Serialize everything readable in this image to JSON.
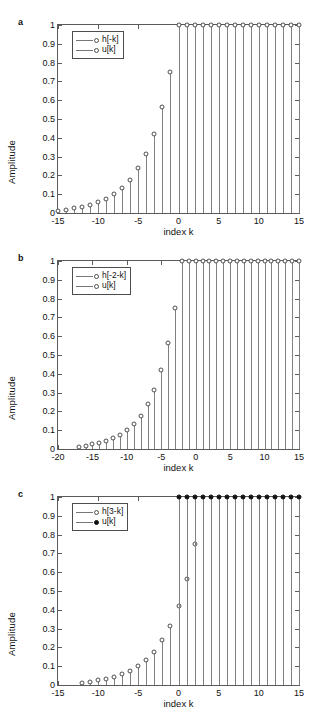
{
  "figure": {
    "panels": [
      {
        "letter": "a",
        "ylabel": "Amplitude",
        "xlabel": "index k",
        "legend": [
          {
            "label": "h[-k]",
            "marker": "open-circle"
          },
          {
            "label": "u[k]",
            "marker": "open-circle"
          }
        ],
        "xticks": [
          "-15",
          "-10",
          "-5",
          "0",
          "5",
          "10",
          "15"
        ],
        "yticks": [
          "0",
          "0.1",
          "0.2",
          "0.3",
          "0.4",
          "0.5",
          "0.6",
          "0.7",
          "0.8",
          "0.9",
          "1"
        ]
      },
      {
        "letter": "b",
        "ylabel": "Amplitude",
        "xlabel": "index k",
        "legend": [
          {
            "label": "h[-2-k]",
            "marker": "open-circle"
          },
          {
            "label": "u[k]",
            "marker": "open-circle"
          }
        ],
        "xticks": [
          "-20",
          "-15",
          "-10",
          "-5",
          "0",
          "5",
          "10",
          "15"
        ],
        "yticks": [
          "0",
          "0.1",
          "0.2",
          "0.3",
          "0.4",
          "0.5",
          "0.6",
          "0.7",
          "0.8",
          "0.9",
          "1"
        ]
      },
      {
        "letter": "c",
        "ylabel": "Amplitude",
        "xlabel": "index k",
        "legend": [
          {
            "label": "h[3-k]",
            "marker": "open-circle"
          },
          {
            "label": "u[k]",
            "marker": "filled-circle"
          }
        ],
        "xticks": [
          "-15",
          "-10",
          "-5",
          "0",
          "5",
          "10",
          "15"
        ],
        "yticks": [
          "0",
          "0.1",
          "0.2",
          "0.3",
          "0.4",
          "0.5",
          "0.6",
          "0.7",
          "0.8",
          "0.9",
          "1"
        ]
      }
    ]
  },
  "chart_data": [
    {
      "type": "line",
      "panel": "a",
      "title": "",
      "xlabel": "index k",
      "ylabel": "Amplitude",
      "xlim": [
        -15,
        15
      ],
      "ylim": [
        0,
        1
      ],
      "grid": false,
      "legend_position": "top-left",
      "series": [
        {
          "name": "h[-k]",
          "marker": "open-circle",
          "x": [
            -15,
            -14,
            -13,
            -12,
            -11,
            -10,
            -9,
            -8,
            -7,
            -6,
            -5,
            -4,
            -3,
            -2,
            -1
          ],
          "values": [
            0.013,
            0.018,
            0.024,
            0.032,
            0.042,
            0.056,
            0.075,
            0.1,
            0.133,
            0.178,
            0.237,
            0.316,
            0.422,
            0.562,
            0.75
          ]
        },
        {
          "name": "u[k]",
          "marker": "open-circle",
          "x": [
            0,
            1,
            2,
            3,
            4,
            5,
            6,
            7,
            8,
            9,
            10,
            11,
            12,
            13,
            14,
            15
          ],
          "values": [
            1,
            1,
            1,
            1,
            1,
            1,
            1,
            1,
            1,
            1,
            1,
            1,
            1,
            1,
            1,
            1
          ]
        }
      ]
    },
    {
      "type": "line",
      "panel": "b",
      "title": "",
      "xlabel": "index k",
      "ylabel": "Amplitude",
      "xlim": [
        -20,
        15
      ],
      "ylim": [
        0,
        1
      ],
      "grid": false,
      "legend_position": "top-left",
      "series": [
        {
          "name": "h[-2-k]",
          "marker": "open-circle",
          "x": [
            -17,
            -16,
            -15,
            -14,
            -13,
            -12,
            -11,
            -10,
            -9,
            -8,
            -7,
            -6,
            -5,
            -4,
            -3
          ],
          "values": [
            0.013,
            0.018,
            0.024,
            0.032,
            0.042,
            0.056,
            0.075,
            0.1,
            0.133,
            0.178,
            0.237,
            0.316,
            0.422,
            0.562,
            0.75
          ]
        },
        {
          "name": "u[k]",
          "marker": "open-circle",
          "x": [
            -2,
            -1,
            0,
            1,
            2,
            3,
            4,
            5,
            6,
            7,
            8,
            9,
            10,
            11,
            12,
            13,
            14,
            15
          ],
          "values": [
            1,
            1,
            1,
            1,
            1,
            1,
            1,
            1,
            1,
            1,
            1,
            1,
            1,
            1,
            1,
            1,
            1,
            1
          ]
        }
      ]
    },
    {
      "type": "line",
      "panel": "c",
      "title": "",
      "xlabel": "index k",
      "ylabel": "Amplitude",
      "xlim": [
        -15,
        15
      ],
      "ylim": [
        0,
        1
      ],
      "grid": false,
      "legend_position": "top-left",
      "series": [
        {
          "name": "h[3-k]",
          "marker": "open-circle",
          "x": [
            -12,
            -11,
            -10,
            -9,
            -8,
            -7,
            -6,
            -5,
            -4,
            -3,
            -2,
            -1,
            0,
            1,
            2
          ],
          "values": [
            0.013,
            0.018,
            0.024,
            0.032,
            0.042,
            0.056,
            0.075,
            0.1,
            0.133,
            0.178,
            0.237,
            0.316,
            0.422,
            0.562,
            0.75
          ]
        },
        {
          "name": "u[k]",
          "marker": "filled-circle",
          "x": [
            0,
            1,
            2,
            3,
            4,
            5,
            6,
            7,
            8,
            9,
            10,
            11,
            12,
            13,
            14,
            15
          ],
          "values": [
            1,
            1,
            1,
            1,
            1,
            1,
            1,
            1,
            1,
            1,
            1,
            1,
            1,
            1,
            1,
            1
          ]
        }
      ]
    }
  ]
}
